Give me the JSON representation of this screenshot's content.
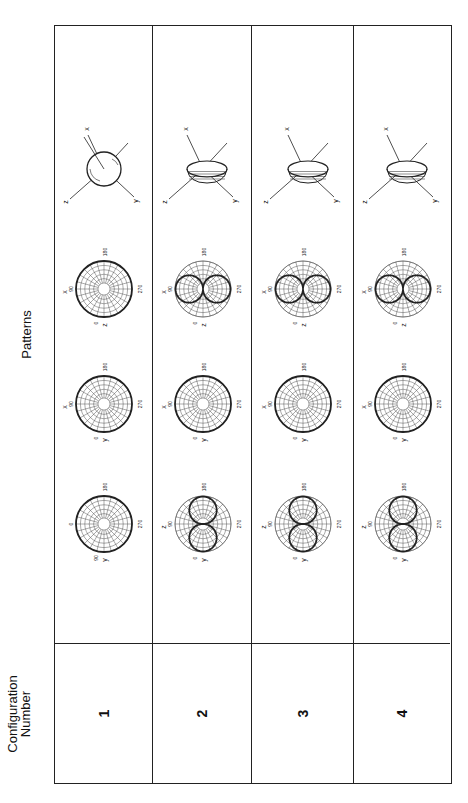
{
  "header": {
    "config_label_line1": "Configuration",
    "config_label_line2": "Number",
    "patterns_label": "Patterns"
  },
  "rows": [
    {
      "number": "1",
      "plots": [
        {
          "type": "polar",
          "top": "y",
          "left_label": "",
          "bottom": "180",
          "right": "270",
          "shape": "circle",
          "top_value": "0",
          "extra": "90"
        },
        {
          "type": "polar",
          "top": "y",
          "left_label": "x",
          "bottom": "180",
          "right": "270",
          "shape": "circle",
          "top_value": "90",
          "extra": "0"
        },
        {
          "type": "polar",
          "top": "z",
          "left_label": "x",
          "bottom": "180",
          "right": "270",
          "shape": "circle",
          "top_value": "90",
          "extra": "0"
        },
        {
          "type": "3d",
          "axes": [
            "x",
            "y",
            "z"
          ],
          "shape": "sphere"
        }
      ]
    },
    {
      "number": "2",
      "plots": [
        {
          "type": "polar",
          "top": "y",
          "left_label": "z",
          "bottom": "180",
          "right": "270",
          "shape": "figure8-horizontal",
          "top_value": "90",
          "extra": "0"
        },
        {
          "type": "polar",
          "top": "y",
          "left_label": "x",
          "bottom": "180",
          "right": "270",
          "shape": "circle",
          "top_value": "90",
          "extra": "0"
        },
        {
          "type": "polar",
          "top": "z",
          "left_label": "x",
          "bottom": "180",
          "right": "270",
          "shape": "figure8-vertical",
          "top_value": "90",
          "extra": "0"
        },
        {
          "type": "3d",
          "axes": [
            "x",
            "y",
            "z"
          ],
          "shape": "toroid"
        }
      ]
    },
    {
      "number": "3",
      "plots": [
        {
          "type": "polar",
          "top": "y",
          "left_label": "z",
          "bottom": "180",
          "right": "270",
          "shape": "figure8-horizontal",
          "top_value": "90",
          "extra": "0"
        },
        {
          "type": "polar",
          "top": "y",
          "left_label": "x",
          "bottom": "180",
          "right": "270",
          "shape": "circle",
          "top_value": "90",
          "extra": "0"
        },
        {
          "type": "polar",
          "top": "z",
          "left_label": "x",
          "bottom": "180",
          "right": "270",
          "shape": "figure8-vertical",
          "top_value": "90",
          "extra": "0"
        },
        {
          "type": "3d",
          "axes": [
            "x",
            "y",
            "z"
          ],
          "shape": "toroid"
        }
      ]
    },
    {
      "number": "4",
      "plots": [
        {
          "type": "polar",
          "top": "y",
          "left_label": "z",
          "bottom": "180",
          "right": "270",
          "shape": "figure8-horizontal",
          "top_value": "90",
          "extra": "0"
        },
        {
          "type": "polar",
          "top": "y",
          "left_label": "x",
          "bottom": "180",
          "right": "270",
          "shape": "circle",
          "top_value": "90",
          "extra": "0"
        },
        {
          "type": "polar",
          "top": "z",
          "left_label": "x",
          "bottom": "180",
          "right": "270",
          "shape": "figure8-vertical",
          "top_value": "90",
          "extra": "0"
        },
        {
          "type": "3d",
          "axes": [
            "x",
            "y",
            "z"
          ],
          "shape": "toroid"
        }
      ]
    }
  ],
  "colors": {
    "line": "#222222",
    "grid": "#555555",
    "background": "#ffffff"
  }
}
